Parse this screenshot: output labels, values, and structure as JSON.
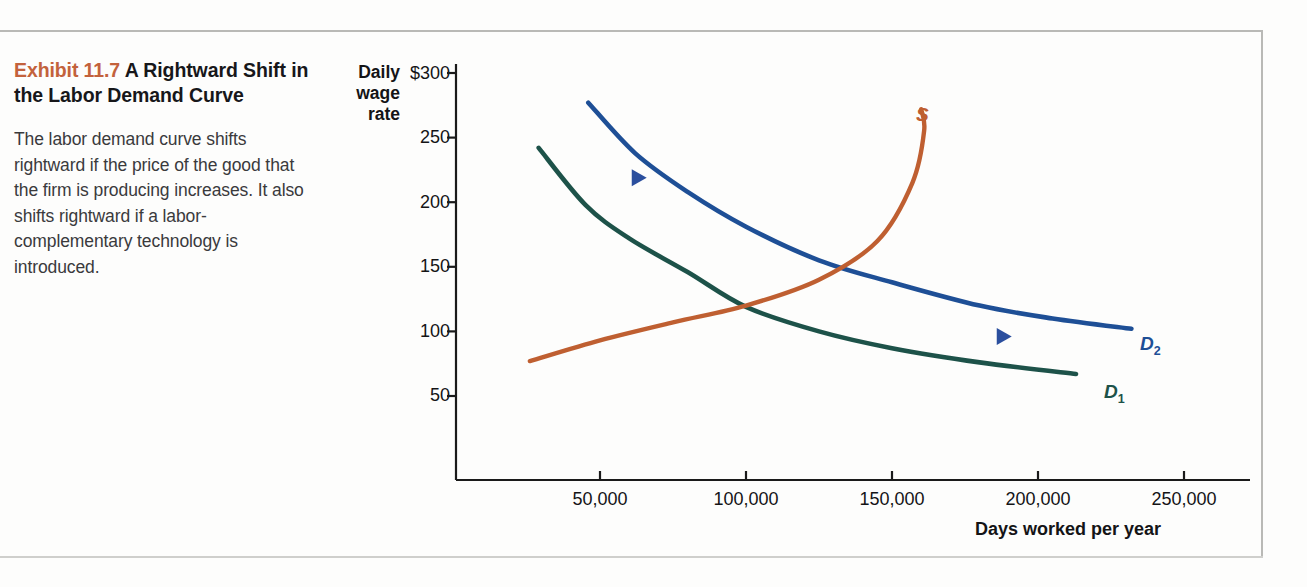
{
  "caption": {
    "exhibit_label": "Exhibit 11.7",
    "title": "A Rightward Shift in the Labor Demand Curve",
    "body": "The labor demand curve shifts rightward if the price of the good that the firm is producing increases. It also shifts rightward if a labor-complementary technology is introduced.",
    "exhibit_color": "#c3623c"
  },
  "chart_data": {
    "type": "line",
    "title": "A Rightward Shift in the Labor Demand Curve",
    "xlabel": "Days worked per year",
    "ylabel": "Daily wage rate",
    "ylabel_lines": [
      "Daily",
      "wage",
      "rate"
    ],
    "xlim": [
      0,
      270000
    ],
    "ylim": [
      0,
      315
    ],
    "grid": false,
    "legend": "inline-curve-labels",
    "xticks": [
      50000,
      100000,
      150000,
      200000,
      250000
    ],
    "xtick_labels": [
      "50,000",
      "100,000",
      "150,000",
      "200,000",
      "250,000"
    ],
    "yticks": [
      50,
      100,
      150,
      200,
      250,
      300
    ],
    "ytick_labels": [
      "50",
      "100",
      "150",
      "200",
      "250",
      "$300"
    ],
    "series": [
      {
        "name": "D1",
        "label": "D",
        "sublabel": "1",
        "role": "original labor demand curve",
        "color": "#1d5249",
        "x": [
          29000,
          45000,
          60000,
          80000,
          100000,
          125000,
          150000,
          180000,
          213000
        ],
        "y": [
          242,
          198,
          172,
          146,
          119,
          100,
          87,
          76,
          67
        ]
      },
      {
        "name": "D2",
        "label": "D",
        "sublabel": "2",
        "role": "new labor demand curve after rightward shift",
        "color": "#1e4f96",
        "x": [
          46000,
          62000,
          80000,
          100000,
          125000,
          150000,
          180000,
          205000,
          232000
        ],
        "y": [
          277,
          238,
          208,
          181,
          155,
          138,
          120,
          110,
          102
        ]
      },
      {
        "name": "S",
        "label": "S",
        "role": "labor supply curve (backward bending at top)",
        "color": "#bf5f31",
        "x": [
          26000,
          50000,
          75000,
          100000,
          125000,
          145000,
          157000,
          161000,
          160000
        ],
        "y": [
          77,
          93,
          107,
          120,
          140,
          170,
          215,
          255,
          272
        ]
      }
    ],
    "annotations": [
      {
        "name": "shift-arrow-upper",
        "type": "arrow",
        "direction": "right",
        "color": "#2b4f9e",
        "x_from": 38000,
        "x_to": 66000,
        "y": 219
      },
      {
        "name": "shift-arrow-lower",
        "type": "arrow",
        "direction": "right",
        "color": "#2b4f9e",
        "x_from": 152000,
        "x_to": 191000,
        "y": 96
      }
    ]
  }
}
